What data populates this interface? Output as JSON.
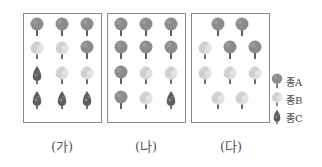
{
  "species": {
    "A": {
      "label": "종A",
      "icon": "round-tree-icon",
      "color": "#8a8a8a"
    },
    "B": {
      "label": "종B",
      "icon": "light-tree-icon",
      "color": "#d4d4d4"
    },
    "C": {
      "label": "종C",
      "icon": "conifer-tree-icon",
      "color": "#6e6e6e"
    }
  },
  "panels": [
    {
      "label": "(가)",
      "grid": [
        [
          "A",
          "A",
          "A"
        ],
        [
          "B",
          "B",
          "A"
        ],
        [
          "C",
          "B",
          "B"
        ],
        [
          "C",
          "C",
          "C"
        ]
      ]
    },
    {
      "label": "(나)",
      "grid": [
        [
          "A",
          "A",
          "A"
        ],
        [
          "A",
          "A",
          "A"
        ],
        [
          "A",
          "B",
          "B"
        ],
        [
          "A",
          "B",
          "C"
        ]
      ]
    },
    {
      "label": "(다)",
      "grid": [
        [
          "A",
          "A"
        ],
        [
          "B",
          "A",
          "A"
        ],
        [
          "B",
          "B",
          "B"
        ],
        [
          "B",
          "B"
        ]
      ]
    }
  ],
  "legend": [
    {
      "key": "A",
      "label": "종A"
    },
    {
      "key": "B",
      "label": "종B"
    },
    {
      "key": "C",
      "label": "종C"
    }
  ]
}
